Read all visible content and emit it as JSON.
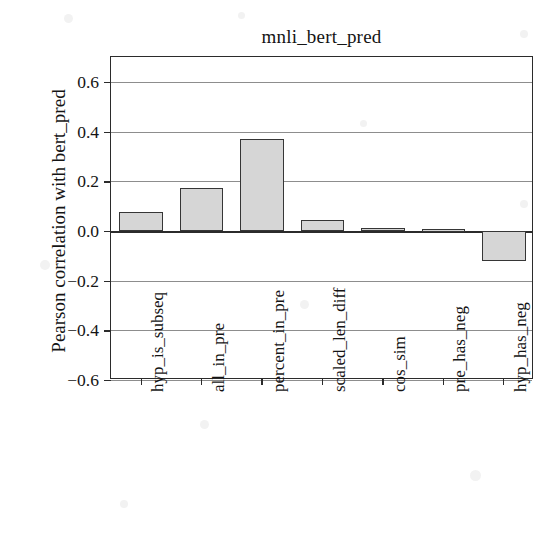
{
  "chart_data": {
    "type": "bar",
    "title": "mnli_bert_pred",
    "xlabel": "",
    "ylabel": "Pearson correlation with bert_pred",
    "categories": [
      "hyp_is_subseq",
      "all_in_pre",
      "percent_in_pre",
      "scaled_len_diff",
      "cos_sim",
      "pre_has_neg",
      "hyp_has_neg"
    ],
    "values": [
      0.078,
      0.172,
      0.37,
      0.042,
      0.013,
      0.007,
      -0.121
    ],
    "ylim": [
      -0.6,
      0.7
    ],
    "yticks": [
      0.6,
      0.4,
      0.2,
      0.0,
      -0.2,
      -0.4,
      -0.6
    ],
    "ytick_labels": [
      "0.6",
      "0.4",
      "0.2",
      "0.0",
      "−0.2",
      "−0.4",
      "−0.6"
    ],
    "grid": true,
    "legend": false,
    "bar_color": "#d6d6d6",
    "bar_edge_color": "#363636",
    "grid_color": "#8d8d8d",
    "axis_color": "#2b2b2b",
    "background": "#ffffff"
  }
}
